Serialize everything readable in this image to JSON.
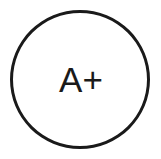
{
  "badge": {
    "grade": "A+",
    "stroke_color": "#1a1a1a",
    "background_color": "#ffffff"
  }
}
